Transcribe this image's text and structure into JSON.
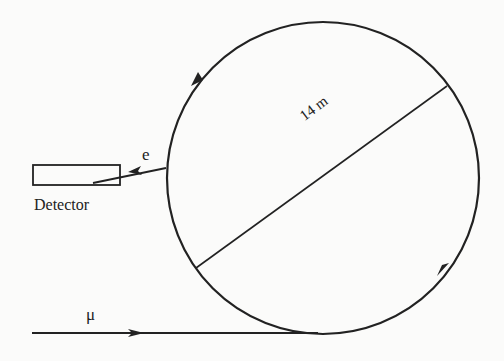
{
  "diagram": {
    "type": "physics-schematic",
    "labels": {
      "electron": "e",
      "detector": "Detector",
      "muon": "μ",
      "diameter": "14 m"
    },
    "ring": {
      "shape": "circle",
      "diameter_m": 14,
      "direction": "counterclockwise as drawn (arrows on top-left and lower-right)"
    },
    "colors": {
      "ink": "#222222",
      "background": "#fbfbfa"
    }
  }
}
